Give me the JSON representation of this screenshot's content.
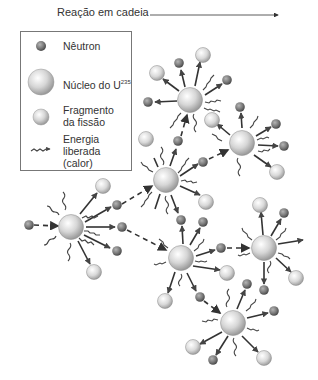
{
  "title": {
    "label": "Reação em cadeia"
  },
  "legend": {
    "items": [
      {
        "icon": "neutron-icon",
        "label": "Nêutron"
      },
      {
        "icon": "uranium-nucleus-icon",
        "label": "Núcleo do U",
        "superscript": "235"
      },
      {
        "icon": "fission-fragment-icon",
        "label_line1": "Fragmento",
        "label_line2": "da fissão"
      },
      {
        "icon": "energy-wave-icon",
        "label_line1": "Energia",
        "label_line2": "liberada",
        "label_line3": "(calor)"
      }
    ]
  },
  "colors": {
    "neutron": "#7a7a7a",
    "nucleus": "#d8d8d8",
    "fragment": "#dcdcdc",
    "arrow": "#333333",
    "text": "#333333"
  },
  "diagram": {
    "nuclei": [
      {
        "id": "N1",
        "x": 71,
        "y": 227
      },
      {
        "id": "N2",
        "x": 166,
        "y": 180
      },
      {
        "id": "N3",
        "x": 190,
        "y": 100
      },
      {
        "id": "N4",
        "x": 242,
        "y": 143
      },
      {
        "id": "N5",
        "x": 181,
        "y": 258
      },
      {
        "id": "N6",
        "x": 264,
        "y": 248
      },
      {
        "id": "N7",
        "x": 233,
        "y": 323
      }
    ]
  }
}
